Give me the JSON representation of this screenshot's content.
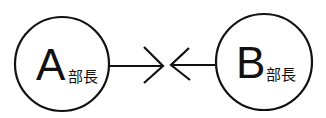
{
  "diagram": {
    "left_node": {
      "letter": "A",
      "title": "部長"
    },
    "right_node": {
      "letter": "B",
      "title": "部長"
    },
    "edges": [
      {
        "from": "A部長",
        "direction": "right",
        "meets": "center"
      },
      {
        "from": "B部長",
        "direction": "left",
        "meets": "center"
      }
    ],
    "stroke_color": "#111111",
    "background": "#ffffff"
  }
}
